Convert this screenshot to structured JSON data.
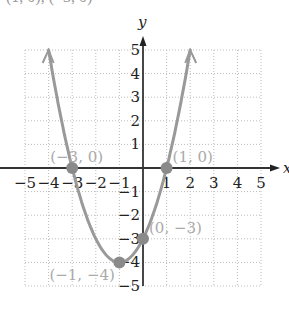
{
  "header": {
    "text": "(1, 0), (−3, 0)"
  },
  "chart_data": {
    "type": "line",
    "title": "",
    "function": "y = x^2 + 2x - 3",
    "xlabel": "x",
    "ylabel": "y",
    "xlim": [
      -5,
      5
    ],
    "ylim": [
      -5,
      5
    ],
    "grid": true,
    "x_ticks": [
      -5,
      -4,
      -3,
      -2,
      -1,
      1,
      2,
      3,
      4,
      5
    ],
    "y_ticks": [
      -5,
      -4,
      -3,
      -2,
      -1,
      1,
      2,
      3,
      4,
      5
    ],
    "x_tick_labels": [
      "−5",
      "−4",
      "−3",
      "−2",
      "−1",
      "1",
      "2",
      "3",
      "4",
      "5"
    ],
    "y_tick_labels": [
      "−5",
      "−4",
      "−3",
      "−2",
      "−1",
      "1",
      "2",
      "3",
      "4",
      "5"
    ],
    "series": [
      {
        "name": "parabola",
        "x": [
          -4,
          -3.5,
          -3,
          -2.5,
          -2,
          -1.5,
          -1,
          -0.5,
          0,
          0.5,
          1,
          1.5,
          2
        ],
        "y": [
          5,
          1.25,
          0,
          -1.75,
          -3,
          -3.75,
          -4,
          -3.75,
          -3,
          -1.75,
          0,
          2.25,
          5
        ],
        "color": "#999999"
      }
    ],
    "points": [
      {
        "x": -3,
        "y": 0,
        "label": "(−3, 0)"
      },
      {
        "x": 1,
        "y": 0,
        "label": "(1, 0)"
      },
      {
        "x": 0,
        "y": -3,
        "label": "(0, −3)"
      },
      {
        "x": -1,
        "y": -4,
        "label": "(−1, −4)"
      }
    ]
  }
}
